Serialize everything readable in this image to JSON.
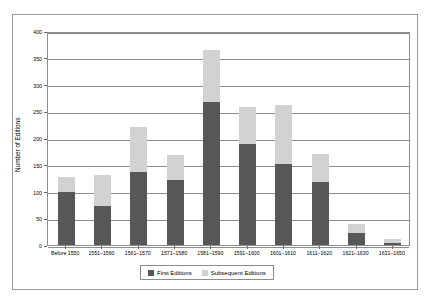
{
  "chart_data": {
    "type": "bar",
    "stacked": true,
    "title": "",
    "subtitle": "",
    "xlabel": "",
    "ylabel": "Number of Editions",
    "ylim": [
      0,
      400
    ],
    "yticks": [
      0,
      50,
      100,
      150,
      200,
      250,
      300,
      350,
      400
    ],
    "grid": true,
    "legend_position": "bottom",
    "categories": [
      "Before 1550",
      "1551–1560",
      "1561–1570",
      "1571–1580",
      "1581–1590",
      "1591–1600",
      "1601–1610",
      "1611–1620",
      "1621–1630",
      "1631–1650"
    ],
    "series": [
      {
        "name": "First Editions",
        "color": "#575757",
        "values": [
          99,
          73,
          137,
          121,
          268,
          189,
          152,
          118,
          22,
          3
        ]
      },
      {
        "name": "Subsequent Editions",
        "color": "#d2d2d2",
        "values": [
          28,
          57,
          83,
          47,
          97,
          69,
          110,
          52,
          18,
          9
        ]
      }
    ],
    "totals": [
      127,
      130,
      220,
      168,
      365,
      258,
      262,
      170,
      40,
      12
    ]
  },
  "colors": {
    "first_editions": "#575757",
    "subsequent_editions": "#d2d2d2",
    "axis": "#8c8c8c",
    "frame": "#9a9a9a",
    "background": "#ffffff"
  },
  "legend": {
    "items": [
      {
        "label": "First Editions",
        "color": "#575757"
      },
      {
        "label": "Subsequent Editions",
        "color": "#d2d2d2"
      }
    ]
  }
}
